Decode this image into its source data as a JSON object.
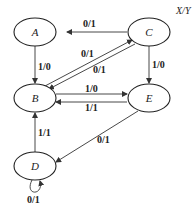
{
  "legend": "X/Y",
  "states": [
    {
      "id": "A",
      "label": "A",
      "cx": 46,
      "cy": 32
    },
    {
      "id": "C",
      "label": "C",
      "cx": 148,
      "cy": 32
    },
    {
      "id": "B",
      "label": "B",
      "cx": 34,
      "cy": 98
    },
    {
      "id": "E",
      "label": "E",
      "cx": 148,
      "cy": 98
    },
    {
      "id": "D",
      "label": "D",
      "cx": 34,
      "cy": 166
    }
  ],
  "transitions": [
    {
      "from": "C",
      "to": "A",
      "label": "0/1"
    },
    {
      "from": "A",
      "to": "B",
      "label": "1/0"
    },
    {
      "from": "B",
      "to": "C",
      "label": "0/1"
    },
    {
      "from": "C",
      "to": "B",
      "label": "0/1"
    },
    {
      "from": "C",
      "to": "E",
      "label": "1/0"
    },
    {
      "from": "B",
      "to": "E",
      "label": "1/0"
    },
    {
      "from": "E",
      "to": "B",
      "label": "1/1"
    },
    {
      "from": "E",
      "to": "D",
      "label": "0/1"
    },
    {
      "from": "D",
      "to": "B",
      "label": "1/1"
    },
    {
      "from": "D",
      "to": "D",
      "label": "0/1"
    }
  ]
}
